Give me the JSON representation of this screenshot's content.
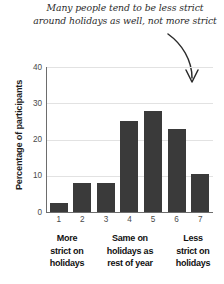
{
  "annotation": {
    "text": "Many people tend to be less strict\naround holidays as well, not more strict",
    "arrow_icon": "curved-down-arrow-icon"
  },
  "chart_data": {
    "type": "bar",
    "title": "",
    "xlabel": "",
    "ylabel": "Percentage of participants",
    "categories": [
      "1",
      "2",
      "3",
      "4",
      "5",
      "6",
      "7"
    ],
    "values": [
      2.5,
      8,
      8,
      25,
      28,
      23,
      10.5
    ],
    "ylim": [
      0,
      40
    ],
    "yticks": [
      "40",
      "30",
      "20",
      "10",
      "0"
    ],
    "ytick_values": [
      40,
      30,
      20,
      10,
      0
    ],
    "grid": true,
    "legend": "none",
    "bar_color": "#3a3a3a",
    "axis_color": "#6d6d6d",
    "grid_color": "#e2e2e2",
    "annotations": [
      {
        "text": "Many people tend to be less strict around holidays as well, not more strict",
        "points_to": "7"
      }
    ],
    "group_labels": [
      {
        "text": "More\nstrict on\nholidays",
        "covers": [
          "1",
          "2",
          "3"
        ]
      },
      {
        "text": "Same on\nholidays as\nrest of year",
        "covers": [
          "3",
          "4",
          "5"
        ]
      },
      {
        "text": "Less\nstrict on\nholidays",
        "covers": [
          "6",
          "7"
        ]
      }
    ]
  }
}
